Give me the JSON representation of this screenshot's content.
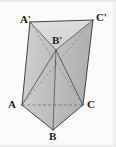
{
  "figure": {
    "kind": "triangular-prism-diagram",
    "background_color": "#fbfbfb",
    "stroke_color": "#3a3a3a",
    "hidden_stroke_color": "#6b6b6b",
    "face_fill_left": "#c9c9c9",
    "face_fill_right": "#bdbdbd",
    "face_fill_top": "#d9d9d9",
    "face_fill_bottom_left": "#c4c4c4",
    "face_fill_bottom_right": "#b4b4b4",
    "vertices": [
      {
        "id": "A-prime",
        "label": "A'",
        "x": 30,
        "y": 22,
        "label_x": 20,
        "label_y": 14
      },
      {
        "id": "B-prime",
        "label": "B'",
        "x": 56,
        "y": 50,
        "label_x": 52,
        "label_y": 35
      },
      {
        "id": "C-prime",
        "label": "C'",
        "x": 93,
        "y": 20,
        "label_x": 96,
        "label_y": 12
      },
      {
        "id": "A",
        "label": "A",
        "x": 22,
        "y": 105,
        "label_x": 8,
        "label_y": 99
      },
      {
        "id": "B",
        "label": "B",
        "x": 53,
        "y": 130,
        "label_x": 49,
        "label_y": 131
      },
      {
        "id": "C",
        "label": "C",
        "x": 83,
        "y": 105,
        "label_x": 87,
        "label_y": 99
      }
    ],
    "edges": [
      {
        "id": "edge-A-prime-C-prime",
        "from": "A-prime",
        "to": "C-prime",
        "style": "solid"
      },
      {
        "id": "edge-A-prime-B-prime",
        "from": "A-prime",
        "to": "B-prime",
        "style": "solid"
      },
      {
        "id": "edge-C-prime-B-prime",
        "from": "C-prime",
        "to": "B-prime",
        "style": "solid"
      },
      {
        "id": "edge-A-prime-A",
        "from": "A-prime",
        "to": "A",
        "style": "solid"
      },
      {
        "id": "edge-C-prime-C",
        "from": "C-prime",
        "to": "C",
        "style": "solid"
      },
      {
        "id": "edge-B-prime-B",
        "from": "B-prime",
        "to": "B",
        "style": "solid"
      },
      {
        "id": "edge-A-B",
        "from": "A",
        "to": "B",
        "style": "solid"
      },
      {
        "id": "edge-B-C",
        "from": "B",
        "to": "C",
        "style": "solid"
      },
      {
        "id": "edge-A-C",
        "from": "A",
        "to": "C",
        "style": "dashed"
      }
    ],
    "diagonals": [
      {
        "id": "diagonal-B-prime-A",
        "from": "B-prime",
        "to": "A",
        "style": "solid"
      },
      {
        "id": "diagonal-B-prime-C",
        "from": "B-prime",
        "to": "C",
        "style": "solid"
      },
      {
        "id": "diagonal-A-prime-C",
        "from": "A-prime",
        "to": "C",
        "style": "dashed"
      },
      {
        "id": "diagonal-C-prime-A",
        "from": "C-prime",
        "to": "A",
        "style": "dashed"
      }
    ]
  }
}
